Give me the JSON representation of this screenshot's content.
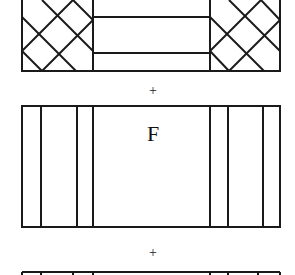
{
  "diagram": {
    "operators": [
      "+",
      "+"
    ],
    "panels": [
      {
        "id": "top-panel",
        "pattern": "cross-hatched end blocks with two horizontal rails in middle",
        "label": ""
      },
      {
        "id": "middle-panel",
        "pattern": "vertical strips at both ends",
        "label": "F"
      },
      {
        "id": "bottom-panel",
        "pattern": "vertical strips at both ends (partially visible)",
        "label": ""
      }
    ],
    "colors": {
      "stroke": "#1a1a1a",
      "background": "#ffffff"
    }
  }
}
